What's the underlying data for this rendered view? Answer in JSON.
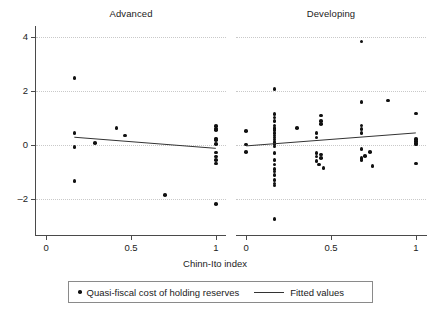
{
  "chart_data": {
    "type": "scatter",
    "title": "",
    "xlabel": "Chinn-Ito index",
    "ylabel": "",
    "xlim": [
      -0.06,
      1.06
    ],
    "ylim": [
      -3.1,
      4.4
    ],
    "grid": true,
    "legend_position": "bottom",
    "facet_by": "economy group",
    "y_ticks": [
      "4",
      "2",
      "0",
      "-2"
    ],
    "y_tick_values": [
      4,
      2,
      0,
      -2
    ],
    "x_ticks": [
      "0",
      "0.5",
      "1"
    ],
    "x_tick_values": [
      0,
      0.5,
      1
    ],
    "legend": [
      {
        "label": "Quasi-fiscal cost of holding reserves",
        "marker": "dot"
      },
      {
        "label": "Fitted values",
        "marker": "line"
      }
    ],
    "panels": [
      {
        "title": "Advanced",
        "series": [
          {
            "name": "Quasi-fiscal cost of holding reserves",
            "marker": "dot",
            "points": [
              [
                0.166,
                2.48
              ],
              [
                0.166,
                0.44
              ],
              [
                0.166,
                -0.07
              ],
              [
                0.166,
                -1.33
              ],
              [
                0.289,
                0.08
              ],
              [
                0.415,
                0.63
              ],
              [
                0.466,
                0.36
              ],
              [
                0.7,
                -1.85
              ],
              [
                1.0,
                0.7
              ],
              [
                1.0,
                0.62
              ],
              [
                1.0,
                0.55
              ],
              [
                1.0,
                0.25
              ],
              [
                1.0,
                0.18
              ],
              [
                1.0,
                0.05
              ],
              [
                1.0,
                -0.28
              ],
              [
                1.0,
                -0.42
              ],
              [
                1.0,
                -0.55
              ],
              [
                1.0,
                -0.68
              ],
              [
                1.0,
                -2.17
              ]
            ]
          },
          {
            "name": "Fitted values",
            "marker": "line",
            "points": [
              [
                0.166,
                0.29
              ],
              [
                1.0,
                -0.12
              ]
            ]
          }
        ]
      },
      {
        "title": "Developing",
        "series": [
          {
            "name": "Quasi-fiscal cost of holding reserves",
            "marker": "dot",
            "points": [
              [
                0.0,
                0.51
              ],
              [
                0.0,
                0.02
              ],
              [
                0.0,
                -0.25
              ],
              [
                0.166,
                2.07
              ],
              [
                0.166,
                1.15
              ],
              [
                0.166,
                1.02
              ],
              [
                0.166,
                0.88
              ],
              [
                0.166,
                0.72
              ],
              [
                0.166,
                0.63
              ],
              [
                0.166,
                0.55
              ],
              [
                0.166,
                0.45
              ],
              [
                0.166,
                0.36
              ],
              [
                0.166,
                0.28
              ],
              [
                0.166,
                0.2
              ],
              [
                0.166,
                0.12
              ],
              [
                0.166,
                0.04
              ],
              [
                0.166,
                -0.05
              ],
              [
                0.166,
                -0.3
              ],
              [
                0.166,
                -0.55
              ],
              [
                0.166,
                -0.72
              ],
              [
                0.166,
                -0.88
              ],
              [
                0.166,
                -0.98
              ],
              [
                0.166,
                -1.1
              ],
              [
                0.166,
                -1.3
              ],
              [
                0.166,
                -1.42
              ],
              [
                0.166,
                -1.5
              ],
              [
                0.166,
                -2.72
              ],
              [
                0.3,
                0.64
              ],
              [
                0.415,
                0.45
              ],
              [
                0.415,
                0.28
              ],
              [
                0.415,
                -0.3
              ],
              [
                0.415,
                -0.42
              ],
              [
                0.415,
                -0.58
              ],
              [
                0.44,
                0.88
              ],
              [
                0.44,
                0.78
              ],
              [
                0.44,
                1.1
              ],
              [
                0.44,
                -0.35
              ],
              [
                0.44,
                -0.48
              ],
              [
                0.455,
                -0.85
              ],
              [
                0.43,
                -0.72
              ],
              [
                0.68,
                3.82
              ],
              [
                0.68,
                1.6
              ],
              [
                0.68,
                0.72
              ],
              [
                0.68,
                0.6
              ],
              [
                0.68,
                0.45
              ],
              [
                0.68,
                -0.15
              ],
              [
                0.68,
                -0.48
              ],
              [
                0.68,
                -0.55
              ],
              [
                0.7,
                -0.4
              ],
              [
                0.73,
                -0.25
              ],
              [
                0.745,
                -0.78
              ],
              [
                0.835,
                1.65
              ],
              [
                1.0,
                1.16
              ],
              [
                1.0,
                0.22
              ],
              [
                1.0,
                0.15
              ],
              [
                1.0,
                0.08
              ],
              [
                1.0,
                0.02
              ],
              [
                1.0,
                -0.68
              ]
            ]
          },
          {
            "name": "Fitted values",
            "marker": "line",
            "points": [
              [
                0.0,
                -0.03
              ],
              [
                1.0,
                0.45
              ]
            ]
          }
        ]
      }
    ]
  },
  "axis": {
    "x_title": "Chinn-Ito index"
  }
}
